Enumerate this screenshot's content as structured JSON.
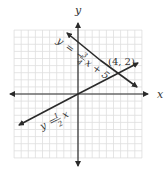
{
  "chart_data": {
    "type": "line",
    "title": "",
    "xlabel": "x",
    "ylabel": "y",
    "grid": true,
    "series": [
      {
        "name": "y = -3/4 x + 5",
        "label_parts": {
          "lhs": "y",
          "eq": "=",
          "sign": "−",
          "num": "3",
          "den": "4",
          "rest": "x + 5"
        },
        "slope": -0.75,
        "intercept": 5
      },
      {
        "name": "y = 1/2 x",
        "label_parts": {
          "lhs": "y",
          "eq": "=",
          "num": "1",
          "den": "2",
          "rest": "x"
        },
        "slope": 0.5,
        "intercept": 0
      }
    ],
    "annotations": [
      {
        "text": "(4, 2)",
        "x": 4,
        "y": 2,
        "note": "intersection point"
      }
    ]
  },
  "colors": {
    "grid": "#dedede",
    "axis": "#2a2a2a",
    "line": "#2a2a2a",
    "text": "#333333"
  }
}
